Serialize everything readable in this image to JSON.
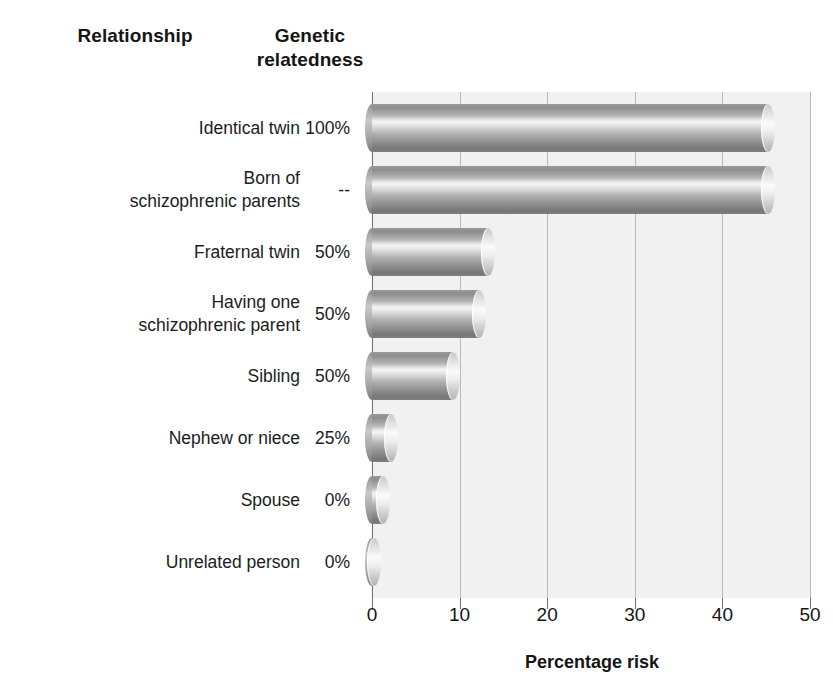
{
  "headers": {
    "relationship": "Relationship",
    "relatedness": "Genetic relatedness"
  },
  "axis_title": "Percentage risk",
  "colors": {
    "plot_background": "#f1f1f1",
    "gridline": "#b9b9b9",
    "axis": "#6f6f6f",
    "text": "#1c1c1c",
    "bar_light": "#f4f4f4",
    "bar_dark": "#777777"
  },
  "chart_data": {
    "type": "bar",
    "orientation": "horizontal",
    "title": "",
    "xlabel": "Percentage risk",
    "ylabel": "Relationship",
    "xlim": [
      0,
      50
    ],
    "xticks": [
      0,
      10,
      20,
      30,
      40,
      50
    ],
    "xtick_labels": [
      "0",
      "10",
      "20",
      "30",
      "40",
      "50"
    ],
    "grid": true,
    "legend": false,
    "categories": [
      "Identical twin",
      "Born of schizophrenic parents",
      "Fraternal twin",
      "Having one schizophrenic parent",
      "Sibling",
      "Nephew or niece",
      "Spouse",
      "Unrelated person"
    ],
    "values": [
      46,
      46,
      14,
      13,
      10,
      3,
      2,
      1
    ],
    "relatedness": [
      "100%",
      "--",
      "50%",
      "50%",
      "50%",
      "25%",
      "0%",
      "0%"
    ],
    "rows": [
      {
        "label": "Identical twin",
        "label_lines": [
          "Identical twin"
        ],
        "relatedness": "100%",
        "value": 46
      },
      {
        "label": "Born of schizophrenic parents",
        "label_lines": [
          "Born of",
          "schizophrenic parents"
        ],
        "relatedness": "--",
        "value": 46
      },
      {
        "label": "Fraternal twin",
        "label_lines": [
          "Fraternal twin"
        ],
        "relatedness": "50%",
        "value": 14
      },
      {
        "label": "Having one schizophrenic parent",
        "label_lines": [
          "Having one",
          "schizophrenic parent"
        ],
        "relatedness": "50%",
        "value": 13
      },
      {
        "label": "Sibling",
        "label_lines": [
          "Sibling"
        ],
        "relatedness": "50%",
        "value": 10
      },
      {
        "label": "Nephew or niece",
        "label_lines": [
          "Nephew or niece"
        ],
        "relatedness": "25%",
        "value": 3
      },
      {
        "label": "Spouse",
        "label_lines": [
          "Spouse"
        ],
        "relatedness": "0%",
        "value": 2
      },
      {
        "label": "Unrelated person",
        "label_lines": [
          "Unrelated person"
        ],
        "relatedness": "0%",
        "value": 1
      }
    ]
  }
}
